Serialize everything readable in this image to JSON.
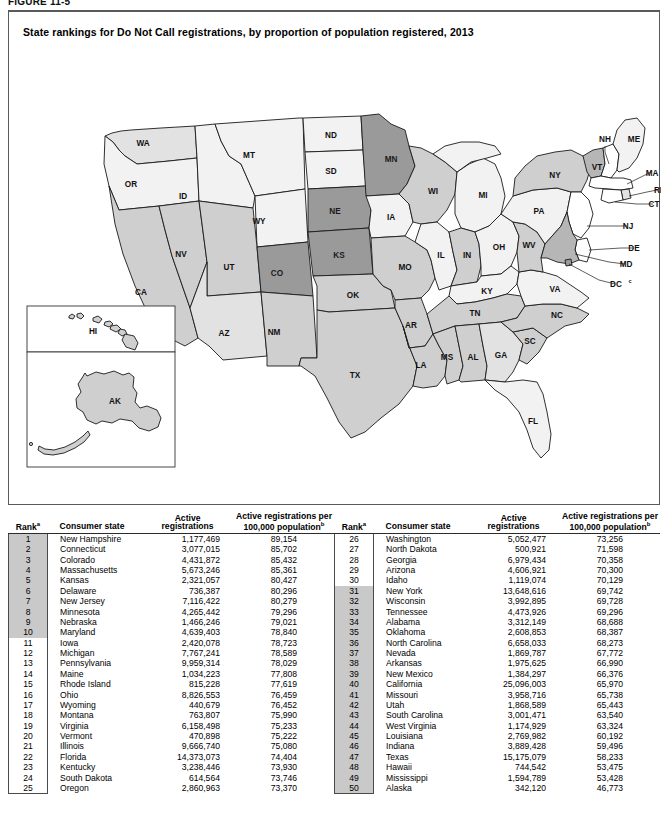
{
  "figure": {
    "label": "FIGURE 11-5",
    "title": "State rankings for Do Not Call registrations, by proportion of population registered, 2013"
  },
  "map": {
    "dc_label": "DC",
    "dc_sup": "c",
    "states": [
      {
        "abbr": "WA",
        "bin": 2
      },
      {
        "abbr": "OR",
        "bin": 1
      },
      {
        "abbr": "CA",
        "bin": 3
      },
      {
        "abbr": "NV",
        "bin": 3
      },
      {
        "abbr": "ID",
        "bin": 1
      },
      {
        "abbr": "MT",
        "bin": 1
      },
      {
        "abbr": "WY",
        "bin": 1
      },
      {
        "abbr": "UT",
        "bin": 3
      },
      {
        "abbr": "AZ",
        "bin": 2
      },
      {
        "abbr": "CO",
        "bin": 5
      },
      {
        "abbr": "NM",
        "bin": 3
      },
      {
        "abbr": "ND",
        "bin": 1
      },
      {
        "abbr": "SD",
        "bin": 1
      },
      {
        "abbr": "NE",
        "bin": 5
      },
      {
        "abbr": "KS",
        "bin": 5
      },
      {
        "abbr": "OK",
        "bin": 3
      },
      {
        "abbr": "TX",
        "bin": 3
      },
      {
        "abbr": "MN",
        "bin": 5
      },
      {
        "abbr": "IA",
        "bin": 1
      },
      {
        "abbr": "MO",
        "bin": 3
      },
      {
        "abbr": "AR",
        "bin": 3
      },
      {
        "abbr": "LA",
        "bin": 3
      },
      {
        "abbr": "WI",
        "bin": 3
      },
      {
        "abbr": "IL",
        "bin": 1
      },
      {
        "abbr": "MI",
        "bin": 1
      },
      {
        "abbr": "IN",
        "bin": 3
      },
      {
        "abbr": "OH",
        "bin": 1
      },
      {
        "abbr": "KY",
        "bin": 1
      },
      {
        "abbr": "TN",
        "bin": 3
      },
      {
        "abbr": "MS",
        "bin": 3
      },
      {
        "abbr": "AL",
        "bin": 3
      },
      {
        "abbr": "GA",
        "bin": 2
      },
      {
        "abbr": "FL",
        "bin": 1
      },
      {
        "abbr": "SC",
        "bin": 3
      },
      {
        "abbr": "NC",
        "bin": 3
      },
      {
        "abbr": "VA",
        "bin": 1
      },
      {
        "abbr": "WV",
        "bin": 3
      },
      {
        "abbr": "PA",
        "bin": 1
      },
      {
        "abbr": "NY",
        "bin": 3
      },
      {
        "abbr": "VT",
        "bin": 4
      },
      {
        "abbr": "NH",
        "bin": 0
      },
      {
        "abbr": "ME",
        "bin": 1
      },
      {
        "abbr": "MA",
        "bin": 0
      },
      {
        "abbr": "RI",
        "bin": 2
      },
      {
        "abbr": "CT",
        "bin": 0
      },
      {
        "abbr": "NJ",
        "bin": 0
      },
      {
        "abbr": "DE",
        "bin": 0
      },
      {
        "abbr": "MD",
        "bin": 4
      },
      {
        "abbr": "HI",
        "bin": 3
      },
      {
        "abbr": "AK",
        "bin": 3
      }
    ],
    "insets": [
      "HI",
      "AK"
    ]
  },
  "table": {
    "headers": {
      "rank": "Rank",
      "rank_sup": "a",
      "state": "Consumer state",
      "active_l1": "Active",
      "active_l2": "registrations",
      "per_l1": "Active registrations per",
      "per_l2": "100,000 population",
      "per_sup": "b"
    },
    "left_rows": [
      {
        "rank": "1",
        "state": "New Hampshire",
        "active": "1,177,469",
        "per": "89,154",
        "shaded": true
      },
      {
        "rank": "2",
        "state": "Connecticut",
        "active": "3,077,015",
        "per": "85,702",
        "shaded": true
      },
      {
        "rank": "3",
        "state": "Colorado",
        "active": "4,431,872",
        "per": "85,432",
        "shaded": true
      },
      {
        "rank": "4",
        "state": "Massachusetts",
        "active": "5,673,246",
        "per": "85,361",
        "shaded": true
      },
      {
        "rank": "5",
        "state": "Kansas",
        "active": "2,321,057",
        "per": "80,427",
        "shaded": true
      },
      {
        "rank": "6",
        "state": "Delaware",
        "active": "736,387",
        "per": "80,296",
        "shaded": true
      },
      {
        "rank": "7",
        "state": "New Jersey",
        "active": "7,116,422",
        "per": "80,279",
        "shaded": true
      },
      {
        "rank": "8",
        "state": "Minnesota",
        "active": "4,265,442",
        "per": "79,296",
        "shaded": true
      },
      {
        "rank": "9",
        "state": "Nebraska",
        "active": "1,466,246",
        "per": "79,021",
        "shaded": true
      },
      {
        "rank": "10",
        "state": "Maryland",
        "active": "4,639,403",
        "per": "78,840",
        "shaded": true
      },
      {
        "rank": "11",
        "state": "Iowa",
        "active": "2,420,078",
        "per": "78,723",
        "shaded": false
      },
      {
        "rank": "12",
        "state": "Michigan",
        "active": "7,767,241",
        "per": "78,589",
        "shaded": false
      },
      {
        "rank": "13",
        "state": "Pennsylvania",
        "active": "9,959,314",
        "per": "78,029",
        "shaded": false
      },
      {
        "rank": "14",
        "state": "Maine",
        "active": "1,034,223",
        "per": "77,808",
        "shaded": false
      },
      {
        "rank": "15",
        "state": "Rhode Island",
        "active": "815,228",
        "per": "77,619",
        "shaded": false
      },
      {
        "rank": "16",
        "state": "Ohio",
        "active": "8,826,553",
        "per": "76,459",
        "shaded": false
      },
      {
        "rank": "17",
        "state": "Wyoming",
        "active": "440,679",
        "per": "76,452",
        "shaded": false
      },
      {
        "rank": "18",
        "state": "Montana",
        "active": "763,807",
        "per": "75,990",
        "shaded": false
      },
      {
        "rank": "19",
        "state": "Virginia",
        "active": "6,158,498",
        "per": "75,233",
        "shaded": false
      },
      {
        "rank": "20",
        "state": "Vermont",
        "active": "470,898",
        "per": "75,222",
        "shaded": false
      },
      {
        "rank": "21",
        "state": "Illinois",
        "active": "9,666,740",
        "per": "75,080",
        "shaded": false
      },
      {
        "rank": "22",
        "state": "Florida",
        "active": "14,373,073",
        "per": "74,404",
        "shaded": false
      },
      {
        "rank": "23",
        "state": "Kentucky",
        "active": "3,238,446",
        "per": "73,930",
        "shaded": false
      },
      {
        "rank": "24",
        "state": "South Dakota",
        "active": "614,564",
        "per": "73,746",
        "shaded": false
      },
      {
        "rank": "25",
        "state": "Oregon",
        "active": "2,860,963",
        "per": "73,370",
        "shaded": false
      }
    ],
    "right_rows": [
      {
        "rank": "26",
        "state": "Washington",
        "active": "5,052,477",
        "per": "73,256",
        "shaded": false
      },
      {
        "rank": "27",
        "state": "North Dakota",
        "active": "500,921",
        "per": "71,598",
        "shaded": false
      },
      {
        "rank": "28",
        "state": "Georgia",
        "active": "6,979,434",
        "per": "70,358",
        "shaded": false
      },
      {
        "rank": "29",
        "state": "Arizona",
        "active": "4,606,921",
        "per": "70,300",
        "shaded": false
      },
      {
        "rank": "30",
        "state": "Idaho",
        "active": "1,119,074",
        "per": "70,129",
        "shaded": false
      },
      {
        "rank": "31",
        "state": "New York",
        "active": "13,648,616",
        "per": "69,742",
        "shaded": true
      },
      {
        "rank": "32",
        "state": "Wisconsin",
        "active": "3,992,895",
        "per": "69,728",
        "shaded": true
      },
      {
        "rank": "33",
        "state": "Tennessee",
        "active": "4,473,926",
        "per": "69,296",
        "shaded": true
      },
      {
        "rank": "34",
        "state": "Alabama",
        "active": "3,312,149",
        "per": "68,688",
        "shaded": true
      },
      {
        "rank": "35",
        "state": "Oklahoma",
        "active": "2,608,853",
        "per": "68,387",
        "shaded": true
      },
      {
        "rank": "36",
        "state": "North Carolina",
        "active": "6,658,033",
        "per": "68,273",
        "shaded": true
      },
      {
        "rank": "37",
        "state": "Nevada",
        "active": "1,869,787",
        "per": "67,772",
        "shaded": true
      },
      {
        "rank": "38",
        "state": "Arkansas",
        "active": "1,975,625",
        "per": "66,990",
        "shaded": true
      },
      {
        "rank": "39",
        "state": "New Mexico",
        "active": "1,384,297",
        "per": "66,376",
        "shaded": true
      },
      {
        "rank": "40",
        "state": "California",
        "active": "25,096,003",
        "per": "65,970",
        "shaded": true
      },
      {
        "rank": "41",
        "state": "Missouri",
        "active": "3,958,716",
        "per": "65,738",
        "shaded": true
      },
      {
        "rank": "42",
        "state": "Utah",
        "active": "1,868,589",
        "per": "65,443",
        "shaded": true
      },
      {
        "rank": "43",
        "state": "South Carolina",
        "active": "3,001,471",
        "per": "63,540",
        "shaded": true
      },
      {
        "rank": "44",
        "state": "West Virginia",
        "active": "1,174,929",
        "per": "63,324",
        "shaded": true
      },
      {
        "rank": "45",
        "state": "Louisiana",
        "active": "2,769,982",
        "per": "60,192",
        "shaded": true
      },
      {
        "rank": "46",
        "state": "Indiana",
        "active": "3,889,428",
        "per": "59,496",
        "shaded": true
      },
      {
        "rank": "47",
        "state": "Texas",
        "active": "15,175,079",
        "per": "58,233",
        "shaded": true
      },
      {
        "rank": "48",
        "state": "Hawaii",
        "active": "744,542",
        "per": "53,475",
        "shaded": true
      },
      {
        "rank": "49",
        "state": "Mississippi",
        "active": "1,594,789",
        "per": "53,428",
        "shaded": true
      },
      {
        "rank": "50",
        "state": "Alaska",
        "active": "342,120",
        "per": "46,773",
        "shaded": true
      }
    ]
  }
}
